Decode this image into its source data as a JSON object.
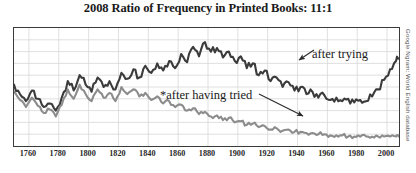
{
  "chart_data": {
    "type": "line",
    "title": "2008 Ratio of Frequency in Printed Books: 11:1",
    "xlabel": "",
    "ylabel": "",
    "grid": true,
    "legend_position": "inline-annotations",
    "xlim": [
      1750,
      2008
    ],
    "ylim": [
      0,
      100
    ],
    "xticks": [
      1760,
      1780,
      1800,
      1820,
      1840,
      1860,
      1880,
      1900,
      1920,
      1940,
      1960,
      1980,
      2000
    ],
    "colors": {
      "after_trying": "#3b3b3b",
      "after_having_tried": "#8c8c8c",
      "grid": "#d8d8d8",
      "frame": "#3a3a3a",
      "text": "#1a1a1a"
    },
    "annotations": [
      {
        "name": "after-trying",
        "text": "after trying",
        "target_series": "after trying"
      },
      {
        "name": "after-having-tried",
        "text": "*after having tried",
        "target_series": "*after having tried"
      }
    ],
    "credit": "Google Ngram: World English database",
    "x": [
      1750,
      1754,
      1758,
      1762,
      1766,
      1770,
      1774,
      1778,
      1782,
      1786,
      1790,
      1794,
      1798,
      1802,
      1806,
      1810,
      1814,
      1818,
      1822,
      1826,
      1830,
      1834,
      1838,
      1842,
      1846,
      1850,
      1854,
      1858,
      1862,
      1866,
      1870,
      1874,
      1878,
      1882,
      1886,
      1890,
      1894,
      1898,
      1902,
      1906,
      1910,
      1914,
      1918,
      1922,
      1926,
      1930,
      1934,
      1938,
      1942,
      1946,
      1950,
      1954,
      1958,
      1962,
      1966,
      1970,
      1974,
      1978,
      1982,
      1986,
      1990,
      1994,
      1998,
      2002,
      2006,
      2008
    ],
    "series": [
      {
        "name": "after trying",
        "color": "#3b3b3b",
        "values": [
          52,
          44,
          38,
          47,
          40,
          33,
          36,
          30,
          41,
          55,
          47,
          60,
          52,
          46,
          58,
          50,
          55,
          48,
          62,
          57,
          65,
          58,
          68,
          62,
          70,
          64,
          72,
          66,
          78,
          71,
          84,
          76,
          88,
          80,
          83,
          75,
          80,
          72,
          76,
          66,
          70,
          60,
          64,
          55,
          58,
          50,
          54,
          47,
          50,
          44,
          46,
          41,
          43,
          39,
          41,
          38,
          40,
          37,
          39,
          38,
          42,
          48,
          56,
          65,
          72,
          74
        ]
      },
      {
        "name": "*after having tried",
        "color": "#8c8c8c",
        "values": [
          46,
          39,
          33,
          41,
          34,
          28,
          31,
          25,
          35,
          48,
          40,
          52,
          44,
          38,
          48,
          41,
          45,
          38,
          50,
          44,
          48,
          42,
          45,
          39,
          42,
          36,
          38,
          33,
          35,
          30,
          32,
          27,
          29,
          25,
          26,
          22,
          24,
          20,
          21,
          18,
          19,
          16,
          17,
          14,
          15,
          13,
          14,
          12,
          12,
          11,
          11,
          10,
          10,
          9,
          9,
          9,
          8,
          8,
          8,
          8,
          8,
          8,
          8,
          8,
          8,
          8
        ]
      }
    ]
  }
}
